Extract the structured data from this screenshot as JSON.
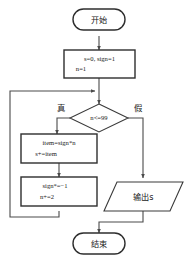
{
  "diagram": {
    "title": "",
    "colors": {
      "background": "#ffffff",
      "stroke": "#3a3a3a",
      "connector": "#4a4a4a",
      "text": "#1a1a1a"
    },
    "nodes": {
      "start": {
        "label": "开始",
        "shape": "terminator"
      },
      "init": {
        "line1": "s=0, sign=1",
        "line2": "n=1",
        "shape": "process"
      },
      "decision": {
        "label": "n<=99",
        "shape": "decision"
      },
      "accumulate": {
        "line1": "item=sign*n",
        "line2": "s+=item",
        "shape": "process"
      },
      "step": {
        "line1": "sign*=−1",
        "line2": "n+=2",
        "shape": "process"
      },
      "output": {
        "label": "输出s",
        "shape": "parallelogram"
      },
      "end": {
        "label": "结束",
        "shape": "terminator"
      }
    },
    "branch_labels": {
      "true": "真",
      "false": "假"
    }
  }
}
